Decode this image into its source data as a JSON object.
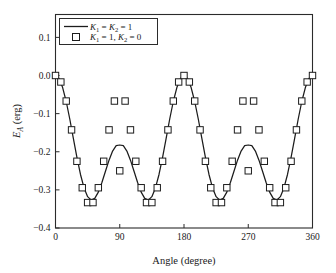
{
  "chart_data": {
    "type": "line",
    "title": "",
    "xlabel": "Angle (degree)",
    "ylabel": "E_A (erg)",
    "ylabel_parts": {
      "base": "E",
      "sub": "A",
      "unit": " (erg)"
    },
    "xlim": [
      0,
      360
    ],
    "ylim": [
      -0.4,
      0.16
    ],
    "xticks": [
      0,
      90,
      180,
      270,
      360
    ],
    "xticklabels": [
      "0",
      "90",
      "180",
      "270",
      "360"
    ],
    "yticks": [
      0.1,
      0.0,
      -0.1,
      -0.2,
      -0.3,
      -0.4
    ],
    "yticklabels": [
      "0.1",
      "0.0",
      "-0.1",
      "-0.2",
      "-0.3",
      "-0.4"
    ],
    "grid": false,
    "legend_position": "upper-left",
    "series": [
      {
        "name": "K_1 = K_2 = 1",
        "name_parts": [
          {
            "base": "K",
            "sub": "1"
          },
          {
            "op": " = "
          },
          {
            "base": "K",
            "sub": "2"
          },
          {
            "op": " = 1"
          }
        ],
        "style": "line",
        "marker": "none",
        "color": "#1c1c1c",
        "x": [
          0,
          5,
          10,
          15,
          20,
          25,
          30,
          35,
          40,
          45,
          50,
          55,
          60,
          65,
          70,
          75,
          80,
          85,
          90,
          95,
          100,
          105,
          110,
          115,
          120,
          125,
          130,
          135,
          140,
          145,
          150,
          155,
          160,
          165,
          170,
          175,
          180,
          185,
          190,
          195,
          200,
          205,
          210,
          215,
          220,
          225,
          230,
          235,
          240,
          245,
          250,
          255,
          260,
          265,
          270,
          275,
          280,
          285,
          290,
          295,
          300,
          305,
          310,
          315,
          320,
          325,
          330,
          335,
          340,
          345,
          350,
          355,
          360
        ],
        "y": [
          0.0,
          -0.0081,
          -0.0316,
          -0.0682,
          -0.1141,
          -0.1647,
          -0.2148,
          -0.2596,
          -0.2949,
          -0.3178,
          -0.3269,
          -0.3223,
          -0.3059,
          -0.2808,
          -0.2513,
          -0.2221,
          -0.1983,
          -0.184,
          -0.1823,
          -0.184,
          -0.1983,
          -0.2221,
          -0.2513,
          -0.2808,
          -0.3059,
          -0.3223,
          -0.3269,
          -0.3178,
          -0.2949,
          -0.2596,
          -0.2148,
          -0.1647,
          -0.1141,
          -0.0682,
          -0.0316,
          -0.0081,
          0.0,
          -0.0081,
          -0.0316,
          -0.0682,
          -0.1141,
          -0.1647,
          -0.2148,
          -0.2596,
          -0.2949,
          -0.3178,
          -0.3269,
          -0.3223,
          -0.3059,
          -0.2808,
          -0.2513,
          -0.2221,
          -0.1983,
          -0.184,
          -0.1823,
          -0.184,
          -0.1983,
          -0.2221,
          -0.2513,
          -0.2808,
          -0.3059,
          -0.3223,
          -0.3269,
          -0.3178,
          -0.2949,
          -0.2596,
          -0.2148,
          -0.1647,
          -0.1141,
          -0.0682,
          -0.0316,
          -0.0081,
          0.0
        ]
      },
      {
        "name": "K_1 = 1, K_2 = 0",
        "name_parts": [
          {
            "base": "K",
            "sub": "1"
          },
          {
            "op": " = 1, "
          },
          {
            "base": "K",
            "sub": "2"
          },
          {
            "op": " = 0"
          }
        ],
        "style": "markers",
        "marker": "square-open",
        "color": "#1c1c1c",
        "x": [
          0,
          7.5,
          15,
          22.5,
          30,
          37.5,
          45,
          52.5,
          60,
          67.5,
          75,
          82.5,
          90,
          97.5,
          105,
          112.5,
          120,
          127.5,
          135,
          142.5,
          150,
          157.5,
          165,
          172.5,
          180,
          187.5,
          195,
          202.5,
          210,
          217.5,
          225,
          232.5,
          240,
          247.5,
          255,
          262.5,
          270,
          277.5,
          285,
          292.5,
          300,
          307.5,
          315,
          322.5,
          330,
          337.5,
          345,
          352.5,
          360
        ],
        "y": [
          0.0,
          -0.017,
          -0.067,
          -0.1426,
          -0.225,
          -0.2944,
          -0.3333,
          -0.3333,
          -0.2944,
          -0.225,
          -0.1426,
          -0.067,
          -0.25,
          -0.067,
          -0.1426,
          -0.225,
          -0.2944,
          -0.3333,
          -0.3333,
          -0.2944,
          -0.225,
          -0.1426,
          -0.067,
          -0.017,
          0.0,
          -0.017,
          -0.067,
          -0.1426,
          -0.225,
          -0.2944,
          -0.3333,
          -0.3333,
          -0.2944,
          -0.225,
          -0.1426,
          -0.067,
          -0.25,
          -0.067,
          -0.1426,
          -0.225,
          -0.2944,
          -0.3333,
          -0.3333,
          -0.2944,
          -0.225,
          -0.1426,
          -0.067,
          -0.017,
          0.0
        ]
      }
    ]
  }
}
